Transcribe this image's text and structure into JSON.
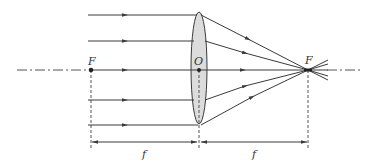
{
  "diagram": {
    "labels": {
      "left_focus": "F",
      "optical_center": "O",
      "right_focus": "F",
      "focal_length_left": "f",
      "focal_length_right": "f"
    },
    "colors": {
      "line": "#3a3a3a",
      "lens_fill": "#d6d6d6",
      "dashed": "#555555",
      "background": "#ffffff"
    },
    "geometry": {
      "axis_y": 70,
      "left_focus_x": 91,
      "lens_x": 199,
      "right_focus_x": 308,
      "ray_heights_y": [
        15,
        41,
        70,
        100,
        125
      ],
      "dimension_line_y": 142
    }
  }
}
